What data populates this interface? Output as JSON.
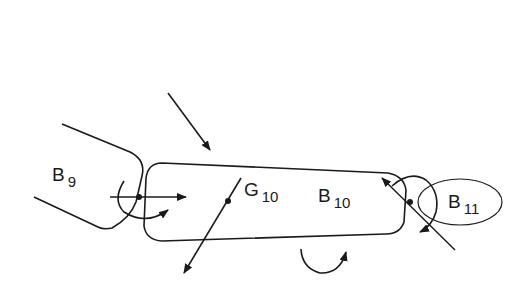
{
  "diagram": {
    "type": "free-body diagram",
    "bodies": [
      {
        "id": "B9",
        "label_main": "B",
        "label_sub": "9"
      },
      {
        "id": "B10",
        "label_main": "B",
        "label_sub": "10"
      },
      {
        "id": "B11",
        "label_main": "B",
        "label_sub": "11"
      }
    ],
    "centroid": {
      "label_main": "G",
      "label_sub": "10"
    },
    "colors": {
      "stroke": "#1a1a1a",
      "background": "#ffffff"
    }
  }
}
